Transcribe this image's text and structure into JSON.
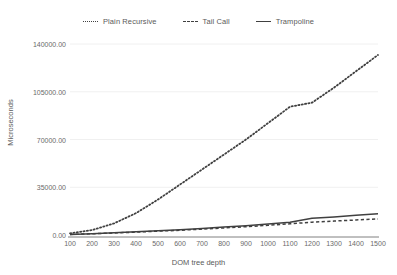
{
  "chart_data": {
    "type": "line",
    "title": "",
    "xlabel": "DOM tree depth",
    "ylabel": "Microseconds",
    "xlim": [
      100,
      1500
    ],
    "ylim": [
      0,
      140000
    ],
    "grid": true,
    "legend_position": "top-center",
    "x": [
      100,
      200,
      300,
      400,
      500,
      600,
      700,
      800,
      900,
      1000,
      1100,
      1200,
      1300,
      1400,
      1500
    ],
    "xticks": [
      "100",
      "200",
      "300",
      "400",
      "500",
      "600",
      "700",
      "800",
      "900",
      "1000",
      "1100",
      "1200",
      "1300",
      "1400",
      "1500"
    ],
    "yticks": [
      "0.00",
      "35000.00",
      "70000.00",
      "105000.00",
      "140000.00"
    ],
    "ytick_values": [
      0,
      35000,
      70000,
      105000,
      140000
    ],
    "series": [
      {
        "name": "Plain Recursive",
        "style": "dotted",
        "color": "#404040",
        "values": [
          1200,
          3600,
          8500,
          16000,
          26000,
          37000,
          48000,
          59000,
          70000,
          82000,
          94000,
          97000,
          108000,
          120000,
          132000
        ]
      },
      {
        "name": "Tail Call",
        "style": "dashed",
        "color": "#404040",
        "values": [
          400,
          900,
          1500,
          2100,
          2800,
          3500,
          4300,
          5200,
          6100,
          7100,
          8200,
          9400,
          10200,
          11000,
          11800
        ]
      },
      {
        "name": "Trampoline",
        "style": "solid",
        "color": "#404040",
        "values": [
          450,
          1000,
          1700,
          2400,
          3100,
          3900,
          4800,
          5800,
          6800,
          8000,
          9300,
          12300,
          13200,
          14400,
          15600
        ]
      }
    ]
  },
  "legend": {
    "items": [
      {
        "label": "Plain Recursive",
        "style": "dotted"
      },
      {
        "label": "Tail Call",
        "style": "dashed"
      },
      {
        "label": "Trampoline",
        "style": "solid"
      }
    ]
  },
  "axes": {
    "y_title": "Microseconds",
    "x_title": "DOM tree depth"
  },
  "colors": {
    "background": "#ffffff",
    "gridline": "#f0f0f0",
    "axis": "#808080",
    "text": "#5a5a5a",
    "series": "#404040"
  }
}
